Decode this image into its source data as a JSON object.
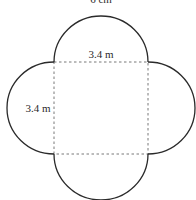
{
  "figure": {
    "top_caption": "6 cm",
    "square": {
      "top_label": "3.4 m",
      "left_label": "3.4 m"
    },
    "colors": {
      "stroke": "#2a2a2a",
      "dashed": "#555555",
      "background": "#ffffff"
    }
  }
}
